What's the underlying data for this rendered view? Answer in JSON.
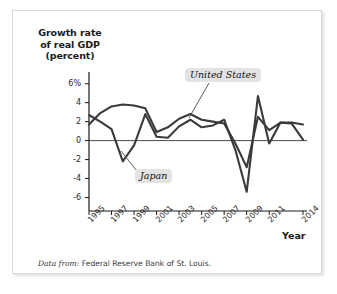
{
  "figure": {
    "y_axis_title_lines": [
      "Growth rate",
      "of real GDP",
      "(percent)"
    ],
    "x_axis_title": "Year",
    "source_prefix": "Data from:",
    "source_text": "Federal Reserve Bank of St. Louis."
  },
  "labels": {
    "united_states": "United States",
    "japan": "Japan"
  },
  "chart_data": {
    "type": "line",
    "title": "",
    "xlabel": "Year",
    "ylabel": "Growth rate of real GDP (percent)",
    "xlim": [
      1995,
      2014
    ],
    "ylim": [
      -7,
      6.6
    ],
    "grid": false,
    "legend_position": "inline-callout",
    "zero_line": true,
    "x": [
      1995,
      1996,
      1997,
      1998,
      1999,
      2000,
      2001,
      2002,
      2003,
      2004,
      2005,
      2006,
      2007,
      2008,
      2009,
      2010,
      2011,
      2012,
      2013,
      2014
    ],
    "x_tick_labels": [
      "1995",
      "1997",
      "1999",
      "2001",
      "2003",
      "2005",
      "2007",
      "2009",
      "2011",
      "2014"
    ],
    "x_tick_values": [
      1995,
      1997,
      1999,
      2001,
      2003,
      2005,
      2007,
      2009,
      2011,
      2014
    ],
    "y_tick_labels": [
      "6%",
      "4",
      "2",
      "0",
      "-2",
      "-4",
      "-6"
    ],
    "y_tick_values": [
      6,
      4,
      2,
      0,
      -2,
      -4,
      -6
    ],
    "series": [
      {
        "name": "United States",
        "color": "#3a3a3a",
        "values": [
          1.7,
          2.9,
          3.6,
          3.8,
          3.7,
          3.4,
          0.9,
          1.4,
          2.3,
          2.8,
          2.2,
          2.0,
          1.8,
          -0.3,
          -2.8,
          2.5,
          1.1,
          1.9,
          1.9,
          1.7
        ]
      },
      {
        "name": "Japan",
        "color": "#3a3a3a",
        "values": [
          2.7,
          2.0,
          1.2,
          -2.2,
          -0.5,
          2.8,
          0.4,
          0.3,
          1.5,
          2.2,
          1.4,
          1.6,
          2.2,
          -1.0,
          -5.4,
          4.7,
          -0.3,
          1.9,
          1.8,
          0.1
        ]
      }
    ],
    "annotations": [
      {
        "text": "United States",
        "points_to_year": 2005,
        "points_to_value": 2.3
      },
      {
        "text": "Japan",
        "points_to_year": 1999,
        "points_to_value": -0.5
      }
    ]
  },
  "colors": {
    "line": "#3a3a3a",
    "axis": "#1a1a1a",
    "callout_bg": "#e3e3e3",
    "frame_border": "#d9d9d9"
  }
}
